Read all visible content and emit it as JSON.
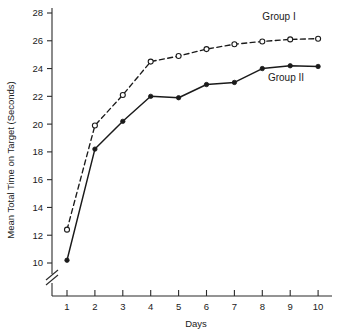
{
  "chart_data": {
    "type": "line",
    "title": "",
    "xlabel": "Days",
    "ylabel": "Mean Total Time on Target (Seconds)",
    "x": [
      1,
      2,
      3,
      4,
      5,
      6,
      7,
      8,
      9,
      10
    ],
    "xtick_labels": [
      "1",
      "2",
      "3",
      "4",
      "5",
      "6",
      "7",
      "8",
      "9",
      "10"
    ],
    "ytick_labels": [
      "10",
      "12",
      "14",
      "16",
      "18",
      "20",
      "22",
      "24",
      "26",
      "28"
    ],
    "yticks": [
      10,
      12,
      14,
      16,
      18,
      20,
      22,
      24,
      26,
      28
    ],
    "xlim": [
      0.55,
      10.6
    ],
    "ylim": [
      10,
      28
    ],
    "grid": false,
    "axis_break": true,
    "legend_position": "inline-annotations",
    "series": [
      {
        "name": "Group I",
        "label": "Group I",
        "marker": "open-circle",
        "linestyle": "dashed",
        "color": "#1a1a1a",
        "values": [
          12.4,
          19.9,
          22.1,
          24.5,
          24.9,
          25.4,
          25.75,
          25.95,
          26.1,
          26.15
        ],
        "label_x": 8.6,
        "label_y": 27.5
      },
      {
        "name": "Group II",
        "label": "Group II",
        "marker": "filled-circle",
        "linestyle": "solid",
        "color": "#1a1a1a",
        "values": [
          10.2,
          18.2,
          20.2,
          22.0,
          21.9,
          22.85,
          23.0,
          24.0,
          24.2,
          24.15
        ],
        "label_x": 8.85,
        "label_y": 23.1
      }
    ]
  }
}
